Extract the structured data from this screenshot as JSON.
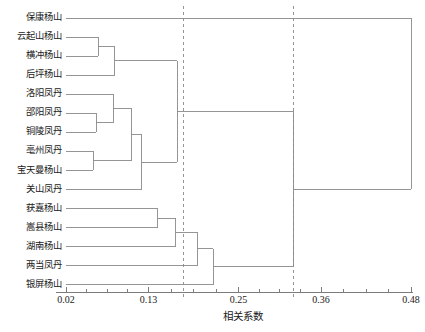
{
  "chart_data": {
    "type": "dendrogram",
    "title": "",
    "xlabel": "相关系数",
    "ylabel": "",
    "xlim": [
      0.02,
      0.48
    ],
    "grid": false,
    "legend": "none",
    "axis": {
      "tick_labels": [
        "0.02",
        "0.13",
        "0.25",
        "0.36",
        "0.48"
      ],
      "tick_values": [
        0.02,
        0.13,
        0.25,
        0.36,
        0.48
      ],
      "minor_ticks_per_interval": 3
    },
    "leaves": [
      {
        "index": 0,
        "label": "保康杨山"
      },
      {
        "index": 1,
        "label": "云起山杨山"
      },
      {
        "index": 2,
        "label": "横冲杨山"
      },
      {
        "index": 3,
        "label": "后坪杨山"
      },
      {
        "index": 4,
        "label": "洛阳凤丹"
      },
      {
        "index": 5,
        "label": "邵阳凤丹"
      },
      {
        "index": 6,
        "label": "铜陵凤丹"
      },
      {
        "index": 7,
        "label": "亳州凤丹"
      },
      {
        "index": 8,
        "label": "宝天曼杨山"
      },
      {
        "index": 9,
        "label": "关山凤丹"
      },
      {
        "index": 10,
        "label": "获嘉杨山"
      },
      {
        "index": 11,
        "label": "嵩县杨山"
      },
      {
        "index": 12,
        "label": "湖南杨山"
      },
      {
        "index": 13,
        "label": "两当凤丹"
      },
      {
        "index": 14,
        "label": "银屏杨山"
      }
    ],
    "merges": [
      {
        "id": "m1",
        "children": [
          "leaf:1",
          "leaf:2"
        ],
        "distance": 0.063
      },
      {
        "id": "m2",
        "children": [
          "m1",
          "leaf:3"
        ],
        "distance": 0.085
      },
      {
        "id": "m3",
        "children": [
          "leaf:5",
          "leaf:6"
        ],
        "distance": 0.06
      },
      {
        "id": "m4",
        "children": [
          "leaf:4",
          "m3"
        ],
        "distance": 0.083
      },
      {
        "id": "m5",
        "children": [
          "leaf:7",
          "leaf:8"
        ],
        "distance": 0.056
      },
      {
        "id": "m6",
        "children": [
          "m4",
          "m5"
        ],
        "distance": 0.107
      },
      {
        "id": "m7",
        "children": [
          "m6",
          "leaf:9"
        ],
        "distance": 0.121
      },
      {
        "id": "m8",
        "children": [
          "m2",
          "m7"
        ],
        "distance": 0.168
      },
      {
        "id": "m9",
        "children": [
          "leaf:10",
          "leaf:11"
        ],
        "distance": 0.142
      },
      {
        "id": "m10",
        "children": [
          "m9",
          "leaf:12"
        ],
        "distance": 0.166
      },
      {
        "id": "m11",
        "children": [
          "m10",
          "leaf:13"
        ],
        "distance": 0.195
      },
      {
        "id": "m12",
        "children": [
          "m11",
          "leaf:14"
        ],
        "distance": 0.216
      },
      {
        "id": "m13",
        "children": [
          "m8",
          "m12"
        ],
        "distance": 0.323
      },
      {
        "id": "m14",
        "children": [
          "leaf:0",
          "m13"
        ],
        "distance": 0.48
      }
    ],
    "cut_lines": [
      {
        "name": "cut-line-1",
        "value": 0.177
      },
      {
        "name": "cut-line-2",
        "value": 0.323
      }
    ]
  }
}
